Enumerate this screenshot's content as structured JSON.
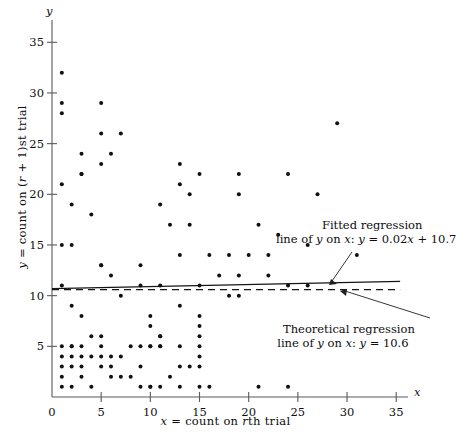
{
  "figure": {
    "background": "#ffffff",
    "ink_color": "#111111"
  },
  "axes": {
    "x_axis_name": "x",
    "y_axis_name": "y",
    "x_title": "x = count on rth trial",
    "y_title": "y = count on (r + 1)st trial",
    "x_ticks": [
      0,
      5,
      10,
      15,
      20,
      25,
      30,
      35
    ],
    "y_ticks": [
      5,
      10,
      15,
      20,
      25,
      30,
      35
    ],
    "x_tick_labels": [
      "0",
      "5",
      "10",
      "15",
      "20",
      "25",
      "30",
      "35"
    ],
    "y_tick_labels": [
      "5",
      "10",
      "15",
      "20",
      "25",
      "30",
      "35"
    ],
    "xlim": [
      0,
      36.2
    ],
    "ylim": [
      0,
      37.2
    ]
  },
  "annotations": {
    "fitted": {
      "line1": "Fitted regression",
      "line2_prefix": "line of ",
      "line2_y": "y",
      "line2_mid": " on ",
      "line2_x": "x",
      "line2_suffix": ":  y = 0.02x + 10.7",
      "full_text": "Fitted regression line of y on x: y = 0.02x + 10.7"
    },
    "theoretical": {
      "line1": "Theoretical regression",
      "line2_prefix": "line of ",
      "line2_y": "y",
      "line2_mid": " on ",
      "line2_x": "x",
      "line2_suffix": ": y = 10.6",
      "full_text": "Theoretical regression line of y on x: y = 10.6"
    }
  },
  "chart_data": {
    "type": "scatter",
    "title": "",
    "xlabel": "x = count on rth trial",
    "ylabel": "y = count on (r + 1)st trial",
    "xlim": [
      0,
      36.2
    ],
    "ylim": [
      0,
      37.2
    ],
    "grid": false,
    "legend": "none",
    "marker": {
      "shape": "circle",
      "size_px": 3.2,
      "color": "#101010"
    },
    "points": [
      [
        1,
        32
      ],
      [
        1,
        29
      ],
      [
        1,
        28
      ],
      [
        1,
        21
      ],
      [
        1,
        15
      ],
      [
        1,
        11
      ],
      [
        1,
        5
      ],
      [
        1,
        4
      ],
      [
        1,
        3
      ],
      [
        1,
        2
      ],
      [
        1,
        1
      ],
      [
        2,
        19
      ],
      [
        2,
        15
      ],
      [
        2,
        9
      ],
      [
        2,
        5
      ],
      [
        2,
        5
      ],
      [
        2,
        4
      ],
      [
        2,
        3
      ],
      [
        2,
        1
      ],
      [
        3,
        22
      ],
      [
        3,
        22
      ],
      [
        3,
        24
      ],
      [
        3,
        8
      ],
      [
        3,
        5
      ],
      [
        3,
        4
      ],
      [
        3,
        3
      ],
      [
        3,
        2
      ],
      [
        4,
        18
      ],
      [
        4,
        6
      ],
      [
        4,
        4
      ],
      [
        4,
        1
      ],
      [
        5,
        29
      ],
      [
        5,
        26
      ],
      [
        5,
        23
      ],
      [
        5,
        13
      ],
      [
        5,
        13
      ],
      [
        5,
        6
      ],
      [
        5,
        5
      ],
      [
        5,
        4
      ],
      [
        5,
        3
      ],
      [
        6,
        24
      ],
      [
        6,
        12
      ],
      [
        6,
        4
      ],
      [
        6,
        3
      ],
      [
        6,
        2
      ],
      [
        7,
        26
      ],
      [
        7,
        10
      ],
      [
        7,
        4
      ],
      [
        7,
        2
      ],
      [
        8,
        5
      ],
      [
        8,
        2
      ],
      [
        9,
        13
      ],
      [
        9,
        11
      ],
      [
        9,
        5
      ],
      [
        9,
        3
      ],
      [
        9,
        1
      ],
      [
        10,
        8
      ],
      [
        10,
        7
      ],
      [
        10,
        5
      ],
      [
        10,
        5
      ],
      [
        10,
        1
      ],
      [
        10,
        1
      ],
      [
        11,
        19
      ],
      [
        11,
        11
      ],
      [
        11,
        6
      ],
      [
        11,
        6
      ],
      [
        11,
        5
      ],
      [
        11,
        5
      ],
      [
        11,
        1
      ],
      [
        12,
        17
      ],
      [
        12,
        2
      ],
      [
        13,
        23
      ],
      [
        13,
        21
      ],
      [
        13,
        14
      ],
      [
        13,
        9
      ],
      [
        13,
        5
      ],
      [
        13,
        3
      ],
      [
        13,
        1
      ],
      [
        14,
        20
      ],
      [
        14,
        17
      ],
      [
        14,
        3
      ],
      [
        15,
        22
      ],
      [
        15,
        11
      ],
      [
        15,
        8
      ],
      [
        15,
        7
      ],
      [
        15,
        6
      ],
      [
        15,
        5
      ],
      [
        15,
        4
      ],
      [
        15,
        3
      ],
      [
        15,
        1
      ],
      [
        16,
        14
      ],
      [
        16,
        1
      ],
      [
        17,
        12
      ],
      [
        18,
        14
      ],
      [
        18,
        10
      ],
      [
        19,
        22
      ],
      [
        19,
        20
      ],
      [
        19,
        12
      ],
      [
        19,
        10
      ],
      [
        20,
        14
      ],
      [
        21,
        17
      ],
      [
        21,
        1
      ],
      [
        22,
        14
      ],
      [
        22,
        12
      ],
      [
        23,
        16
      ],
      [
        24,
        22
      ],
      [
        24,
        11
      ],
      [
        24,
        1
      ],
      [
        26,
        15
      ],
      [
        26,
        11
      ],
      [
        27,
        20
      ],
      [
        29,
        27
      ],
      [
        31,
        14
      ]
    ],
    "series": [
      {
        "name": "Fitted regression line of y on x",
        "type": "line",
        "style": "solid",
        "equation": "y = 0.02x + 10.7",
        "slope": 0.02,
        "intercept": 10.7,
        "x_range": [
          0,
          35.4
        ]
      },
      {
        "name": "Theoretical regression line of y on x",
        "type": "line",
        "style": "dashed",
        "equation": "y = 10.6",
        "slope": 0,
        "intercept": 10.6,
        "x_range": [
          0,
          35.4
        ]
      }
    ]
  }
}
